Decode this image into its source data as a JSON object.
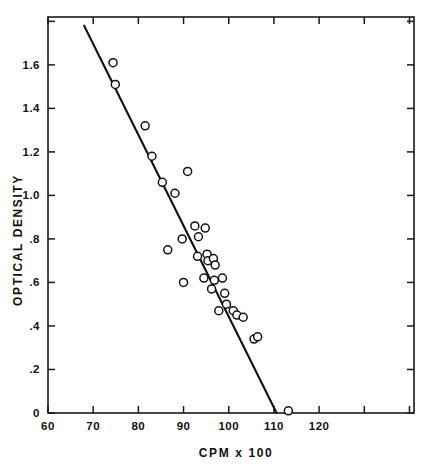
{
  "figure": {
    "background_color": "#ffffff",
    "ink_color": "#111111"
  },
  "axes": {
    "x_title": "CPM x 100",
    "y_title": "OPTICAL DENSITY",
    "x_tick_labels": [
      "60",
      "70",
      "80",
      "90",
      "100",
      "110",
      "120"
    ],
    "y_tick_labels": [
      "1.6",
      "1.4",
      "1.2",
      "1.0",
      ".8",
      ".6",
      ".4",
      ".2",
      "0"
    ]
  },
  "chart_data": {
    "type": "scatter",
    "title": "",
    "xlabel": "CPM x 100",
    "ylabel": "OPTICAL DENSITY",
    "xlim": [
      60,
      141
    ],
    "ylim": [
      0,
      1.82
    ],
    "x_ticks": [
      60,
      70,
      80,
      90,
      100,
      110,
      120
    ],
    "y_ticks": [
      0,
      0.2,
      0.4,
      0.6,
      0.8,
      1.0,
      1.2,
      1.4,
      1.6
    ],
    "grid": false,
    "legend": "none",
    "marker": "open-circle",
    "series": [
      {
        "name": "samples",
        "points": [
          [
            74.4,
            1.61
          ],
          [
            74.9,
            1.51
          ],
          [
            81.5,
            1.32
          ],
          [
            83.0,
            1.18
          ],
          [
            85.3,
            1.06
          ],
          [
            90.9,
            1.11
          ],
          [
            88.1,
            1.01
          ],
          [
            92.5,
            0.86
          ],
          [
            94.8,
            0.85
          ],
          [
            89.7,
            0.8
          ],
          [
            93.3,
            0.81
          ],
          [
            86.5,
            0.75
          ],
          [
            93.1,
            0.72
          ],
          [
            95.2,
            0.73
          ],
          [
            95.4,
            0.7
          ],
          [
            96.6,
            0.71
          ],
          [
            97.0,
            0.68
          ],
          [
            90.0,
            0.6
          ],
          [
            94.5,
            0.62
          ],
          [
            96.8,
            0.61
          ],
          [
            98.6,
            0.62
          ],
          [
            96.2,
            0.57
          ],
          [
            99.1,
            0.55
          ],
          [
            99.5,
            0.5
          ],
          [
            97.8,
            0.47
          ],
          [
            101.0,
            0.47
          ],
          [
            101.8,
            0.45
          ],
          [
            103.2,
            0.44
          ],
          [
            105.6,
            0.34
          ],
          [
            106.4,
            0.35
          ],
          [
            113.2,
            0.01
          ]
        ]
      }
    ],
    "fit_line": {
      "name": "regression line",
      "x_start": 68.0,
      "y_start": 1.78,
      "x_end": 110.6,
      "y_end": 0.0
    }
  }
}
